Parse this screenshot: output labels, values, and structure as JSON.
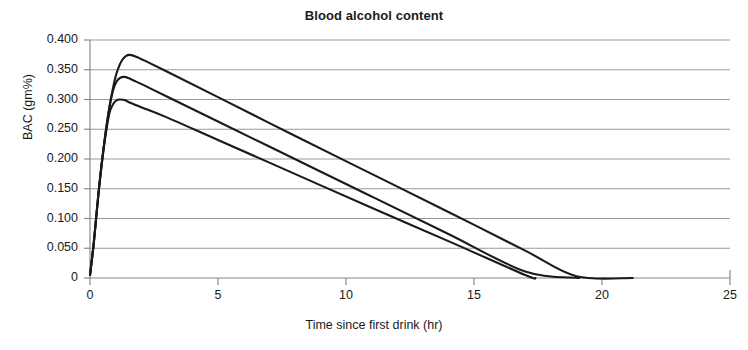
{
  "chart_data": {
    "type": "line",
    "title": "Blood alcohol content",
    "xlabel": "Time since first drink (hr)",
    "ylabel": "BAC (gm%)",
    "xlim": [
      0,
      25
    ],
    "ylim": [
      0,
      0.4
    ],
    "grid": true,
    "legend": "none",
    "xticks": [
      "0",
      "5",
      "10",
      "15",
      "20",
      "25"
    ],
    "xtick_values": [
      0,
      5,
      10,
      15,
      20,
      25
    ],
    "yticks": [
      "0",
      "0.050",
      "0.100",
      "0.150",
      "0.200",
      "0.250",
      "0.300",
      "0.350",
      "0.400"
    ],
    "ytick_values": [
      0,
      0.05,
      0.1,
      0.15,
      0.2,
      0.25,
      0.3,
      0.35,
      0.4
    ],
    "line_color": "#1a1a1a",
    "grid_color": "#9a9a9a",
    "axis_color": "#8a8a8a",
    "series": [
      {
        "name": "curve-upper",
        "peak_time": 1.5,
        "peak_bac": 0.375,
        "zero_time": 21.2,
        "x": [
          0,
          0.15,
          0.35,
          0.55,
          0.75,
          0.95,
          1.1,
          1.25,
          1.4,
          1.55,
          1.8,
          2.2,
          3,
          5,
          8,
          11,
          14,
          17,
          19,
          21.2
        ],
        "values": [
          0.005,
          0.06,
          0.15,
          0.225,
          0.285,
          0.33,
          0.352,
          0.366,
          0.373,
          0.375,
          0.372,
          0.364,
          0.347,
          0.304,
          0.239,
          0.175,
          0.111,
          0.046,
          0.003,
          0
        ]
      },
      {
        "name": "curve-middle",
        "peak_time": 1.35,
        "peak_bac": 0.338,
        "zero_time": 19.1,
        "x": [
          0,
          0.15,
          0.35,
          0.55,
          0.75,
          0.9,
          1.05,
          1.2,
          1.35,
          1.5,
          1.8,
          2.2,
          3,
          5,
          8,
          11,
          14,
          17,
          19.1
        ],
        "values": [
          0.005,
          0.06,
          0.15,
          0.225,
          0.285,
          0.315,
          0.331,
          0.337,
          0.338,
          0.336,
          0.33,
          0.322,
          0.305,
          0.263,
          0.2,
          0.137,
          0.074,
          0.011,
          0
        ]
      },
      {
        "name": "curve-lower",
        "peak_time": 1.25,
        "peak_bac": 0.3,
        "zero_time": 17.4,
        "x": [
          0,
          0.15,
          0.35,
          0.55,
          0.75,
          0.9,
          1.05,
          1.2,
          1.35,
          1.6,
          2,
          3,
          5,
          8,
          11,
          14,
          17,
          17.4
        ],
        "values": [
          0.005,
          0.06,
          0.15,
          0.222,
          0.275,
          0.292,
          0.299,
          0.3,
          0.299,
          0.294,
          0.287,
          0.27,
          0.232,
          0.175,
          0.118,
          0.062,
          0.005,
          0
        ]
      }
    ]
  }
}
